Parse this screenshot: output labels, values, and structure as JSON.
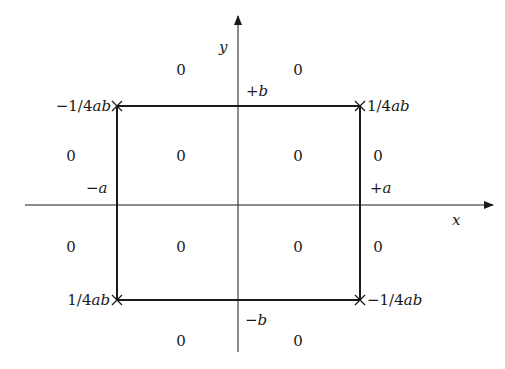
{
  "diagram": {
    "axes": {
      "x_label": "x",
      "y_label": "y"
    },
    "boundary_labels": {
      "plus_b": "+b",
      "minus_b": "−b",
      "minus_a": "−a",
      "plus_a": "+a"
    },
    "corners": {
      "top_left": "−1/4ab",
      "top_right": "1/4ab",
      "bottom_left": "1/4ab",
      "bottom_right": "−1/4ab"
    },
    "region_values": {
      "top_above_left": "0",
      "top_above_right": "0",
      "outside_left_upper": "0",
      "inside_upper_left": "0",
      "inside_upper_right": "0",
      "outside_right_upper": "0",
      "outside_left_lower": "0",
      "inside_lower_left": "0",
      "inside_lower_right": "0",
      "outside_right_lower": "0",
      "bottom_below_left": "0",
      "bottom_below_right": "0"
    },
    "colors": {
      "ink": "#1a1a1a",
      "background": "#ffffff"
    }
  }
}
